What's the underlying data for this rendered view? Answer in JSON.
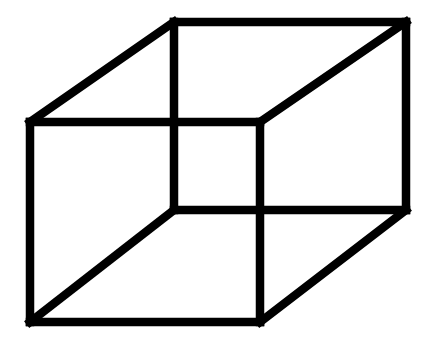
{
  "figure": {
    "type": "necker-cube",
    "stroke_color": "#000000",
    "background": "#ffffff",
    "vertices": {
      "front_tl": [
        30,
        122
      ],
      "front_tr": [
        260,
        122
      ],
      "front_bl": [
        30,
        322
      ],
      "front_br": [
        260,
        322
      ],
      "back_tl": [
        174,
        22
      ],
      "back_tr": [
        406,
        22
      ],
      "back_bl": [
        174,
        210
      ],
      "back_br": [
        406,
        210
      ]
    },
    "edges": [
      [
        "front_tl",
        "front_tr"
      ],
      [
        "front_tr",
        "front_br"
      ],
      [
        "front_br",
        "front_bl"
      ],
      [
        "front_bl",
        "front_tl"
      ],
      [
        "back_tl",
        "back_tr"
      ],
      [
        "back_tr",
        "back_br"
      ],
      [
        "back_br",
        "back_bl"
      ],
      [
        "back_bl",
        "back_tl"
      ],
      [
        "front_tl",
        "back_tl"
      ],
      [
        "front_tr",
        "back_tr"
      ],
      [
        "front_bl",
        "back_bl"
      ],
      [
        "front_br",
        "back_br"
      ]
    ]
  }
}
